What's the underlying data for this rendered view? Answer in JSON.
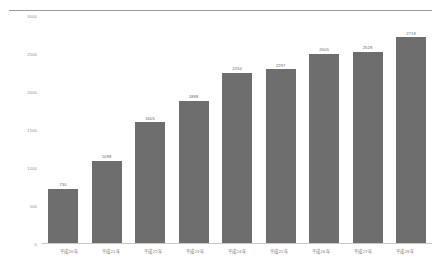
{
  "chart_data": {
    "type": "bar",
    "title": "",
    "xlabel": "",
    "ylabel": "",
    "categories": [
      "平成20年",
      "平成21年",
      "平成22年",
      "平成23年",
      "平成24年",
      "平成25年",
      "平成26年",
      "平成27年",
      "平成28年"
    ],
    "values": [
      730,
      1098,
      1605,
      1888,
      2254,
      2297,
      2505,
      2528,
      2718
    ],
    "value_labels": [
      "730",
      "1098",
      "1605",
      "1888",
      "2254",
      "2297",
      "2505",
      "2528",
      "2718"
    ],
    "ylim": [
      0,
      3000
    ],
    "yticks": [
      3000,
      2500,
      2000,
      1500,
      1000,
      500,
      0
    ],
    "ytick_labels": [
      "3000",
      "2500",
      "2000",
      "1500",
      "1000",
      "500",
      "0"
    ],
    "grid": false,
    "legend": "none",
    "series": [
      {
        "name": "",
        "values": [
          730,
          1098,
          1605,
          1888,
          2254,
          2297,
          2505,
          2528,
          2718
        ]
      }
    ],
    "colors": {
      "bar": "#6e6e6e",
      "axis_text": "#8d8d8d",
      "value_text": "#6a6a6a",
      "rule": "#9a9a9a",
      "background": "#ffffff"
    }
  }
}
